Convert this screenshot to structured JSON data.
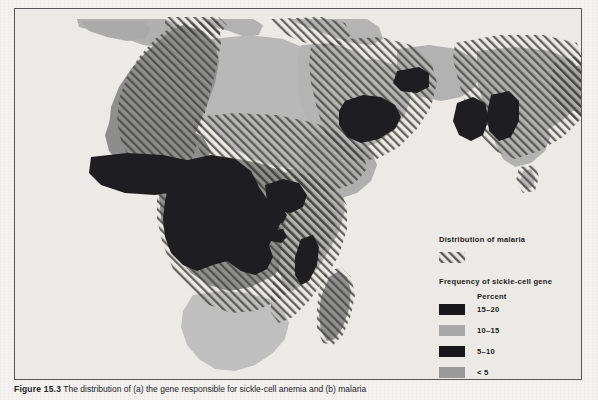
{
  "figure": {
    "caption_label": "Figure 15.3",
    "caption_text": "The distribution of (a) the gene responsible for sickle-cell anemia and (b) malaria"
  },
  "legend": {
    "malaria_heading": "Distribution of malaria",
    "malaria_swatch_name": "diagonal-hatch-swatch",
    "sickle_heading": "Frequency of sickle-cell gene",
    "percent_label": "Percent",
    "entries": [
      {
        "label": "15–20",
        "color": "#17171a",
        "swatch": "black-swatch"
      },
      {
        "label": "10–15",
        "color": "#a9a9a9",
        "swatch": "mid-gray-swatch"
      },
      {
        "label": "5–10",
        "color": "#17171a",
        "swatch": "black-swatch"
      },
      {
        "label": "< 5",
        "color": "#9a9a9a",
        "swatch": "gray-swatch"
      }
    ]
  },
  "map": {
    "title": "Sickle-cell gene frequency and malaria distribution",
    "regions": [
      {
        "name": "west-africa",
        "tier": "10-15",
        "color": "#8e8e8e"
      },
      {
        "name": "sahara-north-africa",
        "tier": "<5",
        "color": "#b4b4b4"
      },
      {
        "name": "central-africa-high",
        "tier": "15-20",
        "color": "#17171a"
      },
      {
        "name": "southern-africa",
        "tier": "<5",
        "color": "#bcbcbc"
      },
      {
        "name": "madagascar",
        "tier": "10-15",
        "color": "#8e8e8e"
      },
      {
        "name": "arabia",
        "tier": "<5",
        "color": "#b4b4b4"
      },
      {
        "name": "india",
        "tier": "<5",
        "color": "#adadad"
      },
      {
        "name": "southern-europe",
        "tier": "<5",
        "color": "#b0b0b0"
      }
    ],
    "colors": {
      "ocean": "#eceae7",
      "hatch_line": "#44443f",
      "black_tier": "#17171a",
      "mid_gray_tier": "#8e8e8e",
      "light_gray_tier": "#b4b4b4",
      "pale_gray_tier": "#bcbcbc",
      "frame": "#58585a",
      "paper": "#f3f2f0"
    }
  }
}
